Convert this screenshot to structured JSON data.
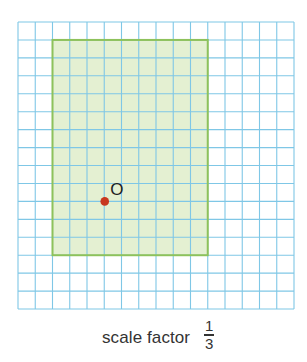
{
  "grid": {
    "left": 18,
    "top": 22,
    "cell_w": 17.25,
    "cell_h": 17.94,
    "cols": 16,
    "rows": 16,
    "line_color": "#7fc7e6"
  },
  "shape": {
    "type": "rectangle",
    "col_start": 2,
    "row_start": 1,
    "width_cells": 9,
    "height_cells": 12,
    "fill": "#e4f0d2",
    "stroke": "#8ec25b"
  },
  "center_point": {
    "label": "O",
    "col": 5,
    "row": 10,
    "color": "#c8371f"
  },
  "caption": {
    "text": "scale factor",
    "fraction_numerator": "1",
    "fraction_denominator": "3"
  }
}
